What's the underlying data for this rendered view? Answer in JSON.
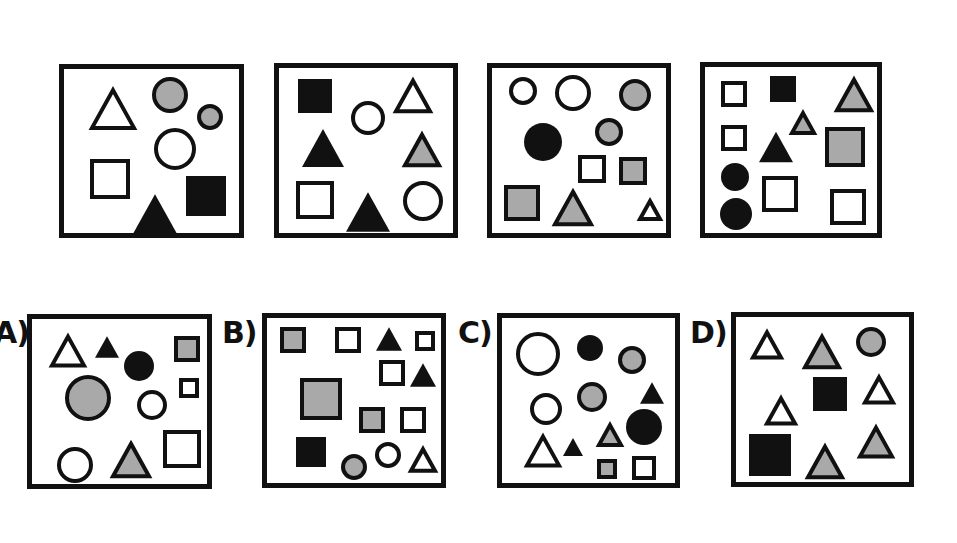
{
  "puzzle": {
    "colors": {
      "black": "#111111",
      "gray": "#a9a9a9",
      "white": "#ffffff",
      "stroke": "#111111"
    },
    "sequence": [
      {
        "id": "seq-1",
        "frame": {
          "x": 59,
          "y": 64,
          "w": 185,
          "h": 174
        },
        "shapes": [
          {
            "type": "triangle",
            "fill": "white",
            "cx": 49,
            "cy": 40,
            "size": 46
          },
          {
            "type": "circle",
            "fill": "gray",
            "cx": 106,
            "cy": 26,
            "r": 18
          },
          {
            "type": "circle",
            "fill": "gray",
            "cx": 146,
            "cy": 48,
            "r": 13
          },
          {
            "type": "circle",
            "fill": "white",
            "cx": 111,
            "cy": 80,
            "r": 21
          },
          {
            "type": "square",
            "fill": "white",
            "cx": 46,
            "cy": 110,
            "size": 40
          },
          {
            "type": "triangle",
            "fill": "black",
            "cx": 91,
            "cy": 145,
            "size": 44
          },
          {
            "type": "square",
            "fill": "black",
            "cx": 142,
            "cy": 127,
            "size": 40
          }
        ]
      },
      {
        "id": "seq-2",
        "frame": {
          "x": 274,
          "y": 63,
          "w": 184,
          "h": 175
        },
        "shapes": [
          {
            "type": "square",
            "fill": "black",
            "cx": 36,
            "cy": 28,
            "size": 34
          },
          {
            "type": "circle",
            "fill": "white",
            "cx": 89,
            "cy": 50,
            "r": 17
          },
          {
            "type": "triangle",
            "fill": "white",
            "cx": 134,
            "cy": 28,
            "size": 38
          },
          {
            "type": "triangle",
            "fill": "black",
            "cx": 44,
            "cy": 80,
            "size": 42
          },
          {
            "type": "triangle",
            "fill": "gray",
            "cx": 143,
            "cy": 82,
            "size": 38
          },
          {
            "type": "square",
            "fill": "white",
            "cx": 36,
            "cy": 132,
            "size": 38
          },
          {
            "type": "triangle",
            "fill": "black",
            "cx": 89,
            "cy": 144,
            "size": 44
          },
          {
            "type": "circle",
            "fill": "white",
            "cx": 144,
            "cy": 133,
            "r": 20
          }
        ]
      },
      {
        "id": "seq-3",
        "frame": {
          "x": 487,
          "y": 63,
          "w": 184,
          "h": 175
        },
        "shapes": [
          {
            "type": "circle",
            "fill": "white",
            "cx": 31,
            "cy": 23,
            "r": 14
          },
          {
            "type": "circle",
            "fill": "white",
            "cx": 81,
            "cy": 25,
            "r": 18
          },
          {
            "type": "circle",
            "fill": "gray",
            "cx": 143,
            "cy": 27,
            "r": 16
          },
          {
            "type": "circle",
            "fill": "black",
            "cx": 51,
            "cy": 74,
            "r": 19
          },
          {
            "type": "circle",
            "fill": "gray",
            "cx": 117,
            "cy": 64,
            "r": 14
          },
          {
            "type": "square",
            "fill": "white",
            "cx": 100,
            "cy": 101,
            "size": 28
          },
          {
            "type": "square",
            "fill": "gray",
            "cx": 141,
            "cy": 103,
            "size": 28
          },
          {
            "type": "square",
            "fill": "gray",
            "cx": 30,
            "cy": 135,
            "size": 36
          },
          {
            "type": "triangle",
            "fill": "gray",
            "cx": 81,
            "cy": 140,
            "size": 40
          },
          {
            "type": "triangle",
            "fill": "white",
            "cx": 158,
            "cy": 142,
            "size": 24
          }
        ]
      },
      {
        "id": "seq-4",
        "frame": {
          "x": 700,
          "y": 62,
          "w": 182,
          "h": 176
        },
        "shapes": [
          {
            "type": "square",
            "fill": "white",
            "cx": 29,
            "cy": 27,
            "size": 26
          },
          {
            "type": "square",
            "fill": "black",
            "cx": 78,
            "cy": 22,
            "size": 26
          },
          {
            "type": "triangle",
            "fill": "gray",
            "cx": 149,
            "cy": 28,
            "size": 38
          },
          {
            "type": "triangle",
            "fill": "gray",
            "cx": 98,
            "cy": 56,
            "size": 26
          },
          {
            "type": "square",
            "fill": "white",
            "cx": 29,
            "cy": 71,
            "size": 26
          },
          {
            "type": "triangle",
            "fill": "black",
            "cx": 71,
            "cy": 80,
            "size": 34
          },
          {
            "type": "square",
            "fill": "gray",
            "cx": 140,
            "cy": 80,
            "size": 40
          },
          {
            "type": "circle",
            "fill": "black",
            "cx": 30,
            "cy": 110,
            "r": 14
          },
          {
            "type": "square",
            "fill": "white",
            "cx": 75,
            "cy": 127,
            "size": 36
          },
          {
            "type": "circle",
            "fill": "black",
            "cx": 31,
            "cy": 147,
            "r": 16
          },
          {
            "type": "square",
            "fill": "white",
            "cx": 143,
            "cy": 140,
            "size": 36
          }
        ]
      }
    ],
    "options": [
      {
        "id": "option-a",
        "label": "A)",
        "label_pos": {
          "x": -6,
          "y": 318
        },
        "frame": {
          "x": 27,
          "y": 314,
          "w": 185,
          "h": 175
        },
        "shapes": [
          {
            "type": "triangle",
            "fill": "white",
            "cx": 36,
            "cy": 32,
            "size": 36
          },
          {
            "type": "triangle",
            "fill": "black",
            "cx": 75,
            "cy": 28,
            "size": 24
          },
          {
            "type": "circle",
            "fill": "black",
            "cx": 107,
            "cy": 47,
            "r": 15
          },
          {
            "type": "square",
            "fill": "gray",
            "cx": 155,
            "cy": 30,
            "size": 26
          },
          {
            "type": "circle",
            "fill": "gray",
            "cx": 56,
            "cy": 79,
            "r": 23
          },
          {
            "type": "square",
            "fill": "white",
            "cx": 157,
            "cy": 69,
            "size": 20
          },
          {
            "type": "circle",
            "fill": "white",
            "cx": 120,
            "cy": 86,
            "r": 15
          },
          {
            "type": "square",
            "fill": "white",
            "cx": 150,
            "cy": 130,
            "size": 38
          },
          {
            "type": "circle",
            "fill": "white",
            "cx": 43,
            "cy": 146,
            "r": 18
          },
          {
            "type": "triangle",
            "fill": "gray",
            "cx": 99,
            "cy": 141,
            "size": 40
          }
        ]
      },
      {
        "id": "option-b",
        "label": "B)",
        "label_pos": {
          "x": 222,
          "y": 318
        },
        "frame": {
          "x": 262,
          "y": 313,
          "w": 184,
          "h": 175
        },
        "shapes": [
          {
            "type": "square",
            "fill": "gray",
            "cx": 26,
            "cy": 22,
            "size": 26
          },
          {
            "type": "square",
            "fill": "white",
            "cx": 81,
            "cy": 22,
            "size": 26
          },
          {
            "type": "triangle",
            "fill": "black",
            "cx": 122,
            "cy": 21,
            "size": 26
          },
          {
            "type": "square",
            "fill": "white",
            "cx": 158,
            "cy": 23,
            "size": 20
          },
          {
            "type": "square",
            "fill": "white",
            "cx": 125,
            "cy": 55,
            "size": 26
          },
          {
            "type": "triangle",
            "fill": "black",
            "cx": 156,
            "cy": 57,
            "size": 26
          },
          {
            "type": "square",
            "fill": "gray",
            "cx": 54,
            "cy": 81,
            "size": 42
          },
          {
            "type": "square",
            "fill": "gray",
            "cx": 105,
            "cy": 102,
            "size": 26
          },
          {
            "type": "square",
            "fill": "white",
            "cx": 146,
            "cy": 102,
            "size": 26
          },
          {
            "type": "square",
            "fill": "black",
            "cx": 44,
            "cy": 134,
            "size": 30
          },
          {
            "type": "circle",
            "fill": "gray",
            "cx": 87,
            "cy": 149,
            "r": 13
          },
          {
            "type": "circle",
            "fill": "white",
            "cx": 121,
            "cy": 137,
            "r": 13
          },
          {
            "type": "triangle",
            "fill": "white",
            "cx": 156,
            "cy": 142,
            "size": 28
          }
        ]
      },
      {
        "id": "option-c",
        "label": "C)",
        "label_pos": {
          "x": 458,
          "y": 318
        },
        "frame": {
          "x": 497,
          "y": 313,
          "w": 183,
          "h": 175
        },
        "shapes": [
          {
            "type": "circle",
            "fill": "white",
            "cx": 36,
            "cy": 36,
            "r": 22
          },
          {
            "type": "circle",
            "fill": "black",
            "cx": 88,
            "cy": 30,
            "r": 13
          },
          {
            "type": "circle",
            "fill": "gray",
            "cx": 130,
            "cy": 42,
            "r": 14
          },
          {
            "type": "triangle",
            "fill": "black",
            "cx": 150,
            "cy": 75,
            "size": 24
          },
          {
            "type": "circle",
            "fill": "white",
            "cx": 44,
            "cy": 91,
            "r": 16
          },
          {
            "type": "circle",
            "fill": "gray",
            "cx": 90,
            "cy": 79,
            "r": 15
          },
          {
            "type": "circle",
            "fill": "black",
            "cx": 142,
            "cy": 109,
            "r": 18
          },
          {
            "type": "triangle",
            "fill": "gray",
            "cx": 108,
            "cy": 117,
            "size": 26
          },
          {
            "type": "triangle",
            "fill": "white",
            "cx": 41,
            "cy": 133,
            "size": 36
          },
          {
            "type": "triangle",
            "fill": "black",
            "cx": 71,
            "cy": 129,
            "size": 20
          },
          {
            "type": "square",
            "fill": "gray",
            "cx": 105,
            "cy": 151,
            "size": 20
          },
          {
            "type": "square",
            "fill": "white",
            "cx": 142,
            "cy": 150,
            "size": 24
          }
        ]
      },
      {
        "id": "option-d",
        "label": "D)",
        "label_pos": {
          "x": 690,
          "y": 318
        },
        "frame": {
          "x": 731,
          "y": 312,
          "w": 183,
          "h": 175
        },
        "shapes": [
          {
            "type": "triangle",
            "fill": "white",
            "cx": 31,
            "cy": 28,
            "size": 32
          },
          {
            "type": "triangle",
            "fill": "gray",
            "cx": 86,
            "cy": 35,
            "size": 38
          },
          {
            "type": "circle",
            "fill": "gray",
            "cx": 135,
            "cy": 25,
            "r": 15
          },
          {
            "type": "square",
            "fill": "black",
            "cx": 94,
            "cy": 77,
            "size": 34
          },
          {
            "type": "triangle",
            "fill": "white",
            "cx": 143,
            "cy": 73,
            "size": 32
          },
          {
            "type": "triangle",
            "fill": "white",
            "cx": 45,
            "cy": 94,
            "size": 32
          },
          {
            "type": "square",
            "fill": "black",
            "cx": 34,
            "cy": 138,
            "size": 42
          },
          {
            "type": "triangle",
            "fill": "gray",
            "cx": 89,
            "cy": 145,
            "size": 38
          },
          {
            "type": "triangle",
            "fill": "gray",
            "cx": 140,
            "cy": 125,
            "size": 36
          }
        ]
      }
    ]
  }
}
